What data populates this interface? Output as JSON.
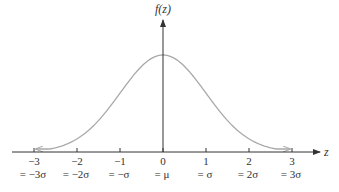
{
  "chart_data": {
    "type": "line",
    "title": "",
    "xlabel": "z",
    "ylabel": "f(z)",
    "x_ticks": [
      -3,
      -2,
      -1,
      0,
      1,
      2,
      3
    ],
    "x_tick_labels": [
      "−3",
      "−2",
      "−1",
      "0",
      "1",
      "2",
      "3"
    ],
    "x_secondary_labels": [
      "= −3σ",
      "= −2σ",
      "= −σ",
      "= μ",
      "= σ",
      "= 2σ",
      "= 3σ"
    ],
    "xlim": [
      -3.5,
      3.5
    ],
    "series": [
      {
        "name": "f(z)",
        "function": "standard normal pdf",
        "x": [
          -2.95,
          -2.5,
          -2,
          -1.5,
          -1,
          -0.5,
          0,
          0.5,
          1,
          1.5,
          2,
          2.5,
          2.95
        ],
        "values": [
          0.005,
          0.018,
          0.054,
          0.13,
          0.242,
          0.352,
          0.399,
          0.352,
          0.242,
          0.13,
          0.054,
          0.018,
          0.005
        ]
      }
    ],
    "grid": false,
    "legend": null,
    "colors": {
      "axis": "#333333",
      "curve": "#a8a8a8",
      "text": "#333333"
    }
  }
}
